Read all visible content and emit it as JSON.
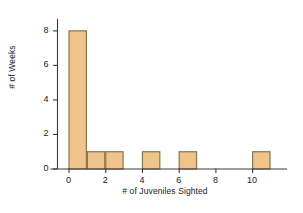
{
  "chart_data": {
    "type": "bar",
    "title": "",
    "subtitle": "",
    "xlabel": "# of Juveniles Sighted",
    "ylabel": "# of Weeks",
    "xlim": [
      -0.6,
      11.9
    ],
    "ylim": [
      0,
      8.6
    ],
    "xticks": [
      0,
      2,
      4,
      6,
      8,
      10
    ],
    "yticks": [
      0,
      2,
      4,
      6,
      8
    ],
    "xtick_labels": [
      "0",
      "2",
      "4",
      "6",
      "8",
      "10"
    ],
    "ytick_labels": [
      "0",
      "2",
      "4",
      "6",
      "8"
    ],
    "grid": false,
    "legend": null,
    "bin_width": 1,
    "bins": [
      {
        "x0": 0,
        "x1": 1,
        "value": 8
      },
      {
        "x0": 1,
        "x1": 2,
        "value": 1
      },
      {
        "x0": 2,
        "x1": 3,
        "value": 1
      },
      {
        "x0": 3,
        "x1": 4,
        "value": 0
      },
      {
        "x0": 4,
        "x1": 5,
        "value": 1
      },
      {
        "x0": 5,
        "x1": 6,
        "value": 0
      },
      {
        "x0": 6,
        "x1": 7,
        "value": 1
      },
      {
        "x0": 7,
        "x1": 8,
        "value": 0
      },
      {
        "x0": 8,
        "x1": 9,
        "value": 0
      },
      {
        "x0": 9,
        "x1": 10,
        "value": 0
      },
      {
        "x0": 10,
        "x1": 11,
        "value": 1
      }
    ],
    "categories": [
      "0-1",
      "1-2",
      "2-3",
      "3-4",
      "4-5",
      "5-6",
      "6-7",
      "7-8",
      "8-9",
      "9-10",
      "10-11"
    ],
    "values": [
      8,
      1,
      1,
      0,
      1,
      0,
      1,
      0,
      0,
      0,
      1
    ],
    "colors": {
      "bar_fill": "#EFC489",
      "bar_edge": "#8A7550",
      "axis": "#3A3A3A",
      "text": "#1A1A1A",
      "background": "#FFFFFF"
    }
  }
}
